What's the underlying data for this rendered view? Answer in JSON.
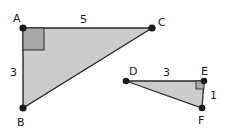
{
  "diagram": {
    "triangle1": {
      "vertices": {
        "A": "A",
        "B": "B",
        "C": "C"
      },
      "sides": {
        "AC": "5",
        "AB": "3"
      },
      "fill": "#cccccc",
      "right_angle_fill": "#a8a8a8"
    },
    "triangle2": {
      "vertices": {
        "D": "D",
        "E": "E",
        "F": "F"
      },
      "sides": {
        "DE": "3",
        "EF": "1"
      },
      "fill": "#cccccc",
      "right_angle_fill": "#a8a8a8"
    },
    "stroke": "#2a2a2a"
  }
}
